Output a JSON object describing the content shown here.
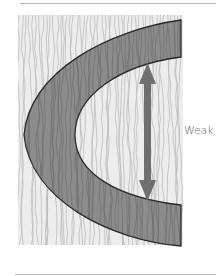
{
  "diagram": {
    "label": "Weak",
    "arrow": "double-headed vertical arrow indicating weak direction",
    "colors": {
      "wood_background": "#e6e6e6",
      "grain_lines": "#b8b8b8",
      "band_fill": "#8a8a8a",
      "band_grain": "#6e6e6e",
      "outline": "#2a2a2a",
      "arrow": "#6a6a6a",
      "rule": "#b5b5b5"
    }
  }
}
